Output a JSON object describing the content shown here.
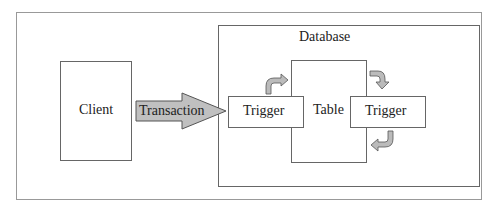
{
  "diagram": {
    "client": {
      "label": "Client"
    },
    "transaction": {
      "label": "Transaction",
      "fill": "#c0c0c0"
    },
    "database": {
      "label": "Database"
    },
    "table": {
      "label": "Table"
    },
    "trigger_left": {
      "label": "Trigger"
    },
    "trigger_right": {
      "label": "Trigger"
    },
    "curved_arrows": [
      "left-trigger-to-table",
      "table-to-right-trigger",
      "right-trigger-to-table"
    ]
  }
}
